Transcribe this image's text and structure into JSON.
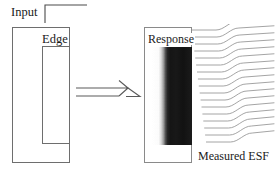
{
  "figure": {
    "background_color": "#ffffff",
    "line_color": "#6e6e6e",
    "text_color": "#1a1a1a"
  },
  "input": {
    "label": "Input",
    "icon": "step-edge-icon",
    "description": "Ideal step edge profile"
  },
  "edge_target": {
    "outer_label": "",
    "inner_label": "Edge",
    "outer_box": {
      "x": 12,
      "y": 27,
      "width": 58,
      "height": 136
    },
    "inner_box": {
      "x": 42,
      "y": 46,
      "width": 28,
      "height": 98
    }
  },
  "arrow": {
    "icon": "right-arrow-icon",
    "direction": "right"
  },
  "response": {
    "label": "Response",
    "image_alt": "blurred noisy edge image",
    "gradient_from": "#ffffff",
    "gradient_to": "#151515",
    "box": {
      "x": 144,
      "y": 27,
      "width": 48,
      "height": 136
    }
  },
  "esf": {
    "label": "Measured ESF",
    "curve_count": 17,
    "curve_color": "#7a7a7a",
    "shape": "sigmoid"
  },
  "chart_data": {
    "type": "line",
    "title": "Measured ESF",
    "xlabel": "",
    "ylabel": "",
    "x": [
      0,
      0.1,
      0.2,
      0.3,
      0.4,
      0.5,
      0.6,
      0.7,
      0.8,
      0.9,
      1.0
    ],
    "series": [
      {
        "name": "ESF scanline 1",
        "offset_x": 0,
        "offset_y": 0,
        "values": [
          0,
          0.01,
          0.04,
          0.14,
          0.36,
          0.62,
          0.82,
          0.93,
          0.98,
          1.0,
          1.0
        ]
      },
      {
        "name": "ESF scanline 2",
        "offset_x": 1,
        "offset_y": 7,
        "values": [
          0,
          0.01,
          0.04,
          0.14,
          0.36,
          0.62,
          0.82,
          0.93,
          0.98,
          1.0,
          1.0
        ]
      },
      {
        "name": "ESF scanline 3",
        "offset_x": 2,
        "offset_y": 14,
        "values": [
          0,
          0.01,
          0.04,
          0.14,
          0.36,
          0.62,
          0.82,
          0.93,
          0.98,
          1.0,
          1.0
        ]
      },
      {
        "name": "ESF scanline 4",
        "offset_x": 3,
        "offset_y": 21,
        "values": [
          0,
          0.01,
          0.04,
          0.14,
          0.36,
          0.62,
          0.82,
          0.93,
          0.98,
          1.0,
          1.0
        ]
      },
      {
        "name": "ESF scanline 5",
        "offset_x": 4,
        "offset_y": 28,
        "values": [
          0,
          0.01,
          0.04,
          0.14,
          0.36,
          0.62,
          0.82,
          0.93,
          0.98,
          1.0,
          1.0
        ]
      },
      {
        "name": "ESF scanline 6",
        "offset_x": 5,
        "offset_y": 35,
        "values": [
          0,
          0.01,
          0.04,
          0.14,
          0.36,
          0.62,
          0.82,
          0.93,
          0.98,
          1.0,
          1.0
        ]
      },
      {
        "name": "ESF scanline 7",
        "offset_x": 6,
        "offset_y": 42,
        "values": [
          0,
          0.01,
          0.04,
          0.14,
          0.36,
          0.62,
          0.82,
          0.93,
          0.98,
          1.0,
          1.0
        ]
      },
      {
        "name": "ESF scanline 8",
        "offset_x": 7,
        "offset_y": 49,
        "values": [
          0,
          0.01,
          0.04,
          0.14,
          0.36,
          0.62,
          0.82,
          0.93,
          0.98,
          1.0,
          1.0
        ]
      },
      {
        "name": "ESF scanline 9",
        "offset_x": 8,
        "offset_y": 56,
        "values": [
          0,
          0.01,
          0.04,
          0.14,
          0.36,
          0.62,
          0.82,
          0.93,
          0.98,
          1.0,
          1.0
        ]
      },
      {
        "name": "ESF scanline 10",
        "offset_x": 9,
        "offset_y": 63,
        "values": [
          0,
          0.01,
          0.04,
          0.14,
          0.36,
          0.62,
          0.82,
          0.93,
          0.98,
          1.0,
          1.0
        ]
      },
      {
        "name": "ESF scanline 11",
        "offset_x": 10,
        "offset_y": 70,
        "values": [
          0,
          0.01,
          0.04,
          0.14,
          0.36,
          0.62,
          0.82,
          0.93,
          0.98,
          1.0,
          1.0
        ]
      },
      {
        "name": "ESF scanline 12",
        "offset_x": 11,
        "offset_y": 77,
        "values": [
          0,
          0.01,
          0.04,
          0.14,
          0.36,
          0.62,
          0.82,
          0.93,
          0.98,
          1.0,
          1.0
        ]
      },
      {
        "name": "ESF scanline 13",
        "offset_x": 12,
        "offset_y": 84,
        "values": [
          0,
          0.01,
          0.04,
          0.14,
          0.36,
          0.62,
          0.82,
          0.93,
          0.98,
          1.0,
          1.0
        ]
      },
      {
        "name": "ESF scanline 14",
        "offset_x": 13,
        "offset_y": 91,
        "values": [
          0,
          0.01,
          0.04,
          0.14,
          0.36,
          0.62,
          0.82,
          0.93,
          0.98,
          1.0,
          1.0
        ]
      },
      {
        "name": "ESF scanline 15",
        "offset_x": 14,
        "offset_y": 98,
        "values": [
          0,
          0.01,
          0.04,
          0.14,
          0.36,
          0.62,
          0.82,
          0.93,
          0.98,
          1.0,
          1.0
        ]
      },
      {
        "name": "ESF scanline 16",
        "offset_x": 15,
        "offset_y": 105,
        "values": [
          0,
          0.01,
          0.04,
          0.14,
          0.36,
          0.62,
          0.82,
          0.93,
          0.98,
          1.0,
          1.0
        ]
      },
      {
        "name": "ESF scanline 17",
        "offset_x": 16,
        "offset_y": 112,
        "values": [
          0,
          0.01,
          0.04,
          0.14,
          0.36,
          0.62,
          0.82,
          0.93,
          0.98,
          1.0,
          1.0
        ]
      }
    ],
    "legend": "none",
    "grid": false
  }
}
